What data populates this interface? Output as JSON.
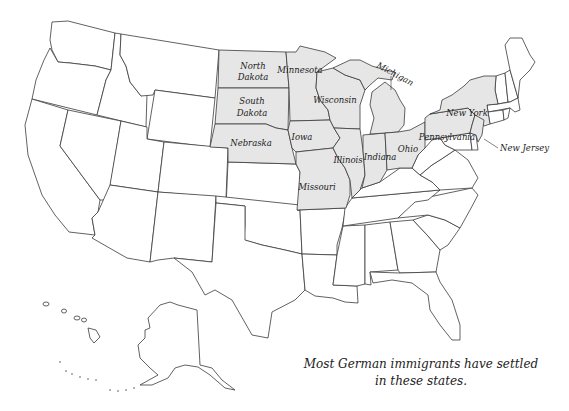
{
  "map": {
    "title": "Most German immigrants have settled in these states.",
    "caption_line1": "Most German immigrants have settled",
    "caption_line2": "in these states.",
    "colors": {
      "highlight": "#e6e6e6",
      "default": "#ffffff",
      "border": "#3a3a3a"
    },
    "highlighted_states": [
      "North Dakota",
      "South Dakota",
      "Nebraska",
      "Minnesota",
      "Iowa",
      "Missouri",
      "Wisconsin",
      "Illinois",
      "Indiana",
      "Michigan",
      "Ohio",
      "Pennsylvania",
      "New York",
      "New Jersey"
    ],
    "labels": {
      "nd1": "North",
      "nd2": "Dakota",
      "sd1": "South",
      "sd2": "Dakota",
      "ne": "Nebraska",
      "mn": "Minnesota",
      "ia": "Iowa",
      "mo": "Missouri",
      "wi": "Wisconsin",
      "il": "Illinois",
      "in": "Indiana",
      "mi": "Michigan",
      "oh": "Ohio",
      "pa": "Pennsylvania",
      "ny": "New York",
      "nj": "New Jersey"
    }
  }
}
